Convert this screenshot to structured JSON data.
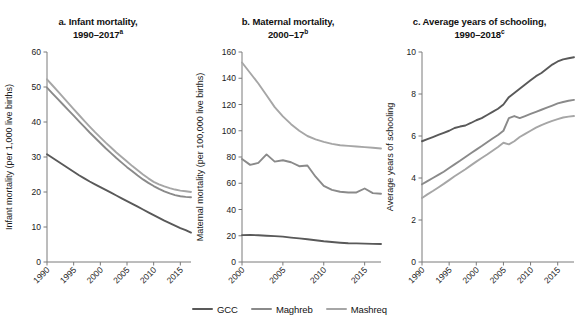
{
  "figure": {
    "background": "#ffffff",
    "width": 579,
    "height": 322
  },
  "series_colors": {
    "GCC": "#595959",
    "Maghreb": "#8a8a8a",
    "Mashreq": "#a6a6a6"
  },
  "legend": {
    "position": "bottom-center",
    "items": [
      {
        "label": "GCC",
        "color": "#595959"
      },
      {
        "label": "Maghreb",
        "color": "#8a8a8a"
      },
      {
        "label": "Mashreq",
        "color": "#a6a6a6"
      }
    ]
  },
  "panels": {
    "a": {
      "title_line1": "a. Infant mortality,",
      "title_line2": "1990–2017",
      "title_sup": "a"
    },
    "b": {
      "title_line1": "b. Maternal mortality,",
      "title_line2": "2000–17",
      "title_sup": "b"
    },
    "c": {
      "title_line1": "c. Average years of schooling,",
      "title_line2": "1990–2018",
      "title_sup": "c"
    }
  },
  "chart_data": [
    {
      "id": "a",
      "type": "line",
      "title": "a. Infant mortality, 1990–2017a",
      "xlabel": "",
      "ylabel": "Infant mortality (per 1,000 live births)",
      "xlim": [
        1990,
        2017
      ],
      "ylim": [
        0,
        60
      ],
      "yticks": [
        0,
        10,
        20,
        30,
        40,
        50,
        60
      ],
      "ytick_labels": [
        "0",
        "10",
        "20",
        "30",
        "40",
        "50",
        "60"
      ],
      "xticks": [
        1990,
        1995,
        2000,
        2005,
        2010,
        2015
      ],
      "xtick_labels": [
        "1990",
        "1995",
        "2000",
        "2005",
        "2010",
        "2015"
      ],
      "grid": false,
      "x": [
        1990,
        1991,
        1992,
        1993,
        1994,
        1995,
        1996,
        1997,
        1998,
        1999,
        2000,
        2001,
        2002,
        2003,
        2004,
        2005,
        2006,
        2007,
        2008,
        2009,
        2010,
        2011,
        2012,
        2013,
        2014,
        2015,
        2016,
        2017
      ],
      "series": [
        {
          "name": "GCC",
          "color": "#595959",
          "values": [
            30.8,
            29.8,
            28.8,
            27.8,
            26.8,
            25.8,
            24.8,
            23.9,
            23.0,
            22.2,
            21.4,
            20.6,
            19.8,
            19.0,
            18.2,
            17.4,
            16.6,
            15.8,
            15.0,
            14.2,
            13.4,
            12.6,
            11.8,
            11.1,
            10.4,
            9.7,
            9.1,
            8.4
          ]
        },
        {
          "name": "Maghreb",
          "color": "#8a8a8a",
          "values": [
            49.8,
            48.2,
            46.6,
            45.0,
            43.4,
            41.8,
            40.2,
            38.6,
            37.0,
            35.5,
            34.0,
            32.5,
            31.1,
            29.7,
            28.4,
            27.1,
            25.9,
            24.7,
            23.6,
            22.6,
            21.7,
            20.9,
            20.2,
            19.6,
            19.1,
            18.8,
            18.6,
            18.5
          ]
        },
        {
          "name": "Mashreq",
          "color": "#a6a6a6",
          "values": [
            52.2,
            50.5,
            48.8,
            47.1,
            45.4,
            43.7,
            42.0,
            40.3,
            38.7,
            37.1,
            35.6,
            34.1,
            32.7,
            31.3,
            30.0,
            28.7,
            27.4,
            26.2,
            25.0,
            23.9,
            22.9,
            22.2,
            21.6,
            21.1,
            20.7,
            20.4,
            20.2,
            20.0
          ]
        }
      ]
    },
    {
      "id": "b",
      "type": "line",
      "title": "b. Maternal mortality, 2000–17b",
      "xlabel": "",
      "ylabel": "Maternal mortality (per 100,000 live births)",
      "xlim": [
        2000,
        2017
      ],
      "ylim": [
        0,
        160
      ],
      "yticks": [
        0,
        20,
        40,
        60,
        80,
        100,
        120,
        140,
        160
      ],
      "ytick_labels": [
        "0",
        "20",
        "40",
        "60",
        "80",
        "100",
        "120",
        "140",
        "160"
      ],
      "xticks": [
        2000,
        2005,
        2010,
        2015
      ],
      "xtick_labels": [
        "2000",
        "2005",
        "2010",
        "2015"
      ],
      "grid": false,
      "x": [
        2000,
        2001,
        2002,
        2003,
        2004,
        2005,
        2006,
        2007,
        2008,
        2009,
        2010,
        2011,
        2012,
        2013,
        2014,
        2015,
        2016,
        2017
      ],
      "series": [
        {
          "name": "GCC",
          "color": "#595959",
          "values": [
            20.5,
            20.6,
            20.4,
            20.0,
            19.7,
            19.3,
            18.6,
            18.0,
            17.3,
            16.6,
            15.8,
            15.2,
            14.7,
            14.3,
            14.2,
            14.0,
            13.8,
            13.7
          ]
        },
        {
          "name": "Maghreb",
          "color": "#8a8a8a",
          "values": [
            78.5,
            74.0,
            75.5,
            82.0,
            76.5,
            77.5,
            76.0,
            73.0,
            73.5,
            65.0,
            58.0,
            55.0,
            53.5,
            53.0,
            53.0,
            56.0,
            52.5,
            52.0
          ]
        },
        {
          "name": "Mashreq",
          "color": "#a6a6a6",
          "values": [
            152.0,
            144.0,
            136.0,
            127.0,
            118.0,
            111.0,
            105.0,
            100.0,
            96.0,
            93.5,
            91.5,
            90.0,
            89.0,
            88.5,
            88.0,
            87.5,
            87.0,
            86.5
          ]
        }
      ]
    },
    {
      "id": "c",
      "type": "line",
      "title": "c. Average years of schooling, 1990–2018c",
      "xlabel": "",
      "ylabel": "Average years of schooling",
      "xlim": [
        1990,
        2018
      ],
      "ylim": [
        0,
        10
      ],
      "yticks": [
        0,
        2,
        4,
        6,
        8,
        10
      ],
      "ytick_labels": [
        "0",
        "2",
        "4",
        "6",
        "8",
        "10"
      ],
      "xticks": [
        1990,
        1995,
        2000,
        2005,
        2010,
        2015
      ],
      "xtick_labels": [
        "1990",
        "1995",
        "2000",
        "2005",
        "2010",
        "2015"
      ],
      "grid": false,
      "x": [
        1990,
        1991,
        1992,
        1993,
        1994,
        1995,
        1996,
        1997,
        1998,
        1999,
        2000,
        2001,
        2002,
        2003,
        2004,
        2005,
        2006,
        2007,
        2008,
        2009,
        2010,
        2011,
        2012,
        2013,
        2014,
        2015,
        2016,
        2017,
        2018
      ],
      "series": [
        {
          "name": "GCC",
          "color": "#595959",
          "values": [
            5.75,
            5.85,
            5.95,
            6.05,
            6.15,
            6.25,
            6.38,
            6.45,
            6.5,
            6.62,
            6.75,
            6.85,
            7.0,
            7.15,
            7.3,
            7.5,
            7.85,
            8.05,
            8.25,
            8.45,
            8.65,
            8.85,
            9.0,
            9.2,
            9.4,
            9.55,
            9.65,
            9.7,
            9.75
          ]
        },
        {
          "name": "Maghreb",
          "color": "#8a8a8a",
          "values": [
            3.7,
            3.85,
            4.0,
            4.15,
            4.3,
            4.48,
            4.65,
            4.82,
            5.0,
            5.18,
            5.35,
            5.52,
            5.7,
            5.88,
            6.05,
            6.25,
            6.85,
            6.95,
            6.85,
            6.95,
            7.05,
            7.15,
            7.25,
            7.35,
            7.45,
            7.55,
            7.62,
            7.68,
            7.72
          ]
        },
        {
          "name": "Mashreq",
          "color": "#a6a6a6",
          "values": [
            3.05,
            3.22,
            3.38,
            3.55,
            3.72,
            3.9,
            4.08,
            4.25,
            4.42,
            4.6,
            4.78,
            4.95,
            5.12,
            5.3,
            5.48,
            5.68,
            5.6,
            5.75,
            5.95,
            6.1,
            6.25,
            6.4,
            6.52,
            6.62,
            6.72,
            6.8,
            6.88,
            6.92,
            6.95
          ]
        }
      ]
    }
  ]
}
